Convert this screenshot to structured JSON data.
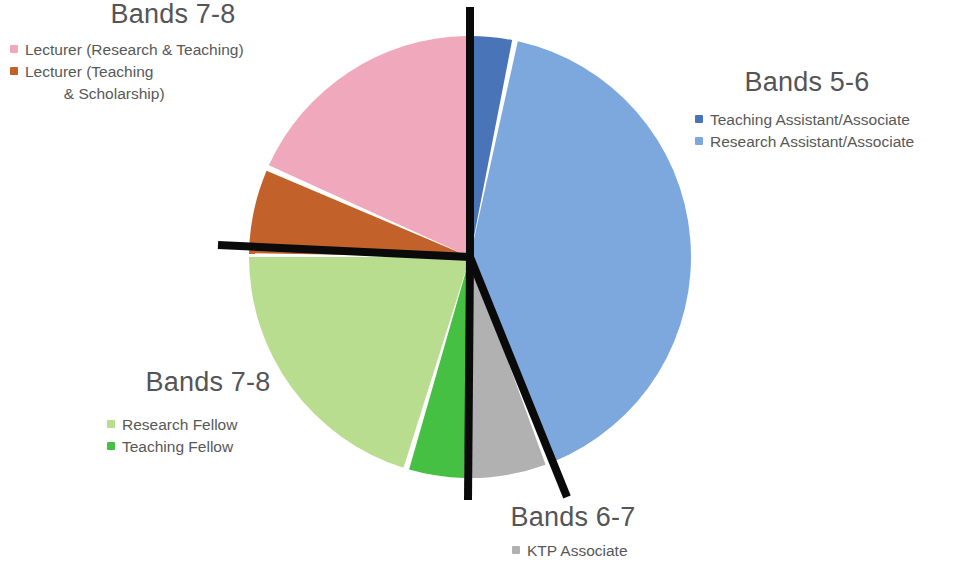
{
  "chart_data": {
    "type": "pie",
    "title": "",
    "center": {
      "x": 470,
      "y": 257
    },
    "radius": 221,
    "grid": false,
    "legend_position": "around-chart",
    "annotations": [
      "Black axis lines divide the pie into band groups: vertical line top (12 o'clock), horizontal line left (9 o'clock), and a diagonal line toward lower-right separating Bands 6-7 from Bands 5-6, plus a vertical line bottom (6 o'clock)."
    ],
    "categories": [
      "Teaching Assistant/Associate",
      "Research Assistant/Associate",
      "KTP Associate",
      "Teaching Fellow",
      "Research Fellow",
      "Lecturer (Teaching & Scholarship)",
      "Lecturer (Research & Teaching)"
    ],
    "values": [
      3,
      40.5,
      5.5,
      4,
      20,
      6,
      17.5
    ],
    "slices": [
      {
        "label": "Teaching Assistant/Associate",
        "band": "Bands 5-6",
        "color": "#4a74b8",
        "start_deg": 0.0,
        "end_deg": 11.0,
        "value": 3.0
      },
      {
        "label": "Research Assistant/Associate",
        "band": "Bands 5-6",
        "color": "#7ca8de",
        "start_deg": 12.5,
        "end_deg": 158.0,
        "value": 40.5
      },
      {
        "label": "KTP Associate",
        "band": "Bands 6-7",
        "color": "#b1b1b1",
        "start_deg": 160.0,
        "end_deg": 180.0,
        "value": 5.5
      },
      {
        "label": "Teaching Fellow",
        "band": "Bands 7-8",
        "color": "#45c043",
        "start_deg": 181.5,
        "end_deg": 196.0,
        "value": 4.0
      },
      {
        "label": "Research Fellow",
        "band": "Bands 7-8",
        "color": "#b8dd8e",
        "start_deg": 197.5,
        "end_deg": 270.0,
        "value": 20.0
      },
      {
        "label": "Lecturer (Teaching & Scholarship)",
        "band": "Bands 7-8",
        "color": "#c2622a",
        "start_deg": 271.0,
        "end_deg": 293.0,
        "value": 6.0
      },
      {
        "label": "Lecturer (Research & Teaching)",
        "band": "Bands 7-8",
        "color": "#f0a8bc",
        "start_deg": 294.5,
        "end_deg": 359.0,
        "value": 17.5
      }
    ]
  },
  "legends": {
    "bands78_lecturer": {
      "title": "Bands 7-8",
      "items": [
        {
          "label": "Lecturer (Research & Teaching)",
          "color": "#f0a8bc"
        },
        {
          "label": "Lecturer (Teaching\n         & Scholarship)",
          "color": "#c2622a"
        }
      ]
    },
    "bands56": {
      "title": "Bands 5-6",
      "items": [
        {
          "label": "Teaching Assistant/Associate",
          "color": "#4a74b8"
        },
        {
          "label": "Research Assistant/Associate",
          "color": "#7ca8de"
        }
      ]
    },
    "bands78_fellow": {
      "title": "Bands 7-8",
      "items": [
        {
          "label": "Research Fellow",
          "color": "#b8dd8e"
        },
        {
          "label": "Teaching Fellow",
          "color": "#45c043"
        }
      ]
    },
    "bands67": {
      "title": "Bands 6-7",
      "items": [
        {
          "label": "KTP Associate",
          "color": "#b1b1b1"
        }
      ]
    }
  },
  "axis_lines": {
    "color": "#0a0a0a",
    "segments": [
      {
        "name": "vertical-top",
        "x1": 470,
        "y1": 7,
        "x2": 470,
        "y2": 257
      },
      {
        "name": "horizontal-left",
        "x1": 218,
        "y1": 245,
        "x2": 470,
        "y2": 257
      },
      {
        "name": "vertical-bottom",
        "x1": 470,
        "y1": 257,
        "x2": 468,
        "y2": 500
      },
      {
        "name": "diagonal-lower-right",
        "x1": 470,
        "y1": 257,
        "x2": 567,
        "y2": 497
      }
    ]
  }
}
